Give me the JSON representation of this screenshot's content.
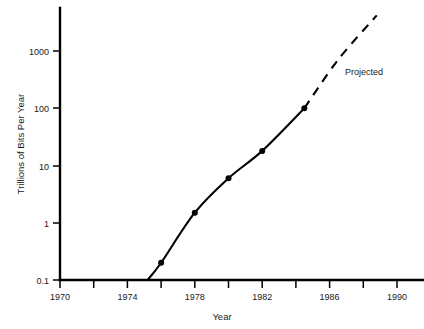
{
  "chart_data": {
    "type": "line",
    "title": "",
    "xlabel": "Year",
    "ylabel": "Trillions of Bits Per Year",
    "xlim": [
      1970,
      1991.6
    ],
    "ylim": [
      0.1,
      5000
    ],
    "yscale": "log",
    "grid": false,
    "legend": null,
    "xticks": [
      1970,
      1972,
      1974,
      1976,
      1978,
      1980,
      1982,
      1984,
      1986,
      1988,
      1990
    ],
    "xtick_labels": [
      "1970",
      "",
      "1974",
      "",
      "1978",
      "",
      "1982",
      "",
      "1986",
      "",
      "1990"
    ],
    "yticks": [
      0.1,
      1,
      10,
      100,
      1000
    ],
    "ytick_labels": [
      "0.1",
      "1",
      "10",
      "100",
      "1000"
    ],
    "series": [
      {
        "name": "Actual",
        "style": "solid",
        "markers": true,
        "x": [
          1975.2,
          1976.0,
          1978.0,
          1980.0,
          1982.0,
          1984.5
        ],
        "y": [
          0.1,
          0.2,
          1.5,
          6.0,
          18.0,
          100.0
        ]
      },
      {
        "name": "Projected",
        "style": "dashed",
        "markers": false,
        "x": [
          1984.5,
          1986.5,
          1988.8
        ],
        "y": [
          100.0,
          700.0,
          4200.0
        ]
      }
    ],
    "annotations": [
      {
        "text": "Projected",
        "x": 1987.0,
        "y": 330.0
      }
    ]
  },
  "axis": {
    "x_label": "Year",
    "y_label": "Trillions of Bits Per Year",
    "y_ticks": [
      {
        "label": "1000"
      },
      {
        "label": "100"
      },
      {
        "label": "10"
      },
      {
        "label": "1"
      },
      {
        "label": "0.1"
      }
    ],
    "x_ticks": [
      {
        "label": "1970"
      },
      {
        "label": "1974"
      },
      {
        "label": "1978"
      },
      {
        "label": "1982"
      },
      {
        "label": "1986"
      },
      {
        "label": "1990"
      }
    ]
  },
  "annotations": {
    "projected": "Projected"
  },
  "colors": {
    "ink": "#000000",
    "background": "#ffffff"
  }
}
